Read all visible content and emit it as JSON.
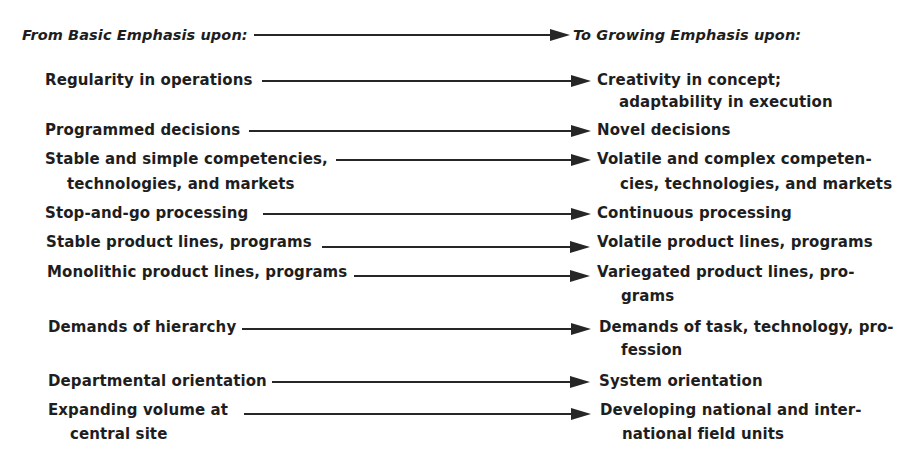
{
  "header": {
    "from_label": "From Basic Emphasis upon:",
    "to_label": "To Growing Emphasis upon:"
  },
  "rows": [
    {
      "from": [
        "Regularity in operations"
      ],
      "to": [
        "Creativity in concept;",
        "adaptability in execution"
      ]
    },
    {
      "from": [
        "Programmed decisions"
      ],
      "to": [
        "Novel decisions"
      ]
    },
    {
      "from": [
        "Stable and simple competencies,",
        "technologies, and markets"
      ],
      "to": [
        "Volatile and complex competen-",
        "cies, technologies, and markets"
      ]
    },
    {
      "from": [
        "Stop-and-go processing"
      ],
      "to": [
        "Continuous processing"
      ]
    },
    {
      "from": [
        "Stable product lines, programs"
      ],
      "to": [
        "Volatile product lines, programs"
      ]
    },
    {
      "from": [
        "Monolithic product lines, programs"
      ],
      "to": [
        "Variegated product lines, pro-",
        "grams"
      ]
    },
    {
      "from": [
        "Demands of hierarchy"
      ],
      "to": [
        "Demands of task, technology, pro-",
        "fession"
      ]
    },
    {
      "from": [
        "Departmental orientation"
      ],
      "to": [
        "System orientation"
      ]
    },
    {
      "from": [
        "Expanding volume at",
        "central site"
      ],
      "to": [
        "Developing national and inter-",
        "national field units"
      ]
    }
  ]
}
